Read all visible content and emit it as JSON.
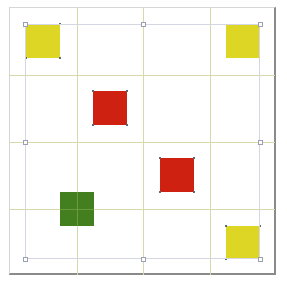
{
  "diagram": {
    "type": "grid-layout",
    "grid": {
      "columns": 4,
      "rows": 4,
      "line_color": "#d8d9a8"
    },
    "selection": {
      "visible": true,
      "border_color": "#d4d6e2",
      "handles": 8
    },
    "colors": {
      "yellow": "#ddd624",
      "red": "#cf2112",
      "green": "#447f1f",
      "frame_shadow": "#8a8a8a"
    },
    "squares": [
      {
        "name": "yellow-square-top-left",
        "color": "yellow",
        "cell": [
          0,
          0
        ]
      },
      {
        "name": "yellow-square-top-right",
        "color": "yellow",
        "cell": [
          3,
          0
        ]
      },
      {
        "name": "red-square-upper",
        "color": "red",
        "cell": [
          1,
          1
        ]
      },
      {
        "name": "red-square-lower",
        "color": "red",
        "cell": [
          2,
          2
        ]
      },
      {
        "name": "green-square",
        "color": "green",
        "cell": [
          0.5,
          2.5
        ]
      },
      {
        "name": "yellow-square-bottom-right",
        "color": "yellow",
        "cell": [
          3,
          3
        ]
      }
    ]
  }
}
